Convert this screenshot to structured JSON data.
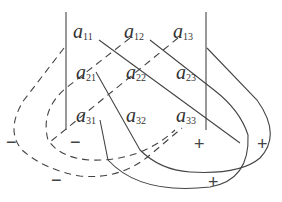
{
  "diagram": {
    "type": "sarrus-rule-determinant",
    "elements": [
      {
        "id": "a11",
        "base": "a",
        "sub": "11",
        "x": 73,
        "y": 38
      },
      {
        "id": "a12",
        "base": "a",
        "sub": "12",
        "x": 124,
        "y": 38
      },
      {
        "id": "a13",
        "base": "a",
        "sub": "13",
        "x": 173,
        "y": 38
      },
      {
        "id": "a21",
        "base": "a",
        "sub": "21",
        "x": 76,
        "y": 79
      },
      {
        "id": "a22",
        "base": "a",
        "sub": "22",
        "x": 126,
        "y": 79
      },
      {
        "id": "a23",
        "base": "a",
        "sub": "23",
        "x": 176,
        "y": 79
      },
      {
        "id": "a31",
        "base": "a",
        "sub": "31",
        "x": 76,
        "y": 122
      },
      {
        "id": "a32",
        "base": "a",
        "sub": "32",
        "x": 126,
        "y": 122
      },
      {
        "id": "a33",
        "base": "a",
        "sub": "33",
        "x": 176,
        "y": 122
      }
    ],
    "signs": [
      {
        "text": "−",
        "x": 6,
        "y": 148
      },
      {
        "text": "−",
        "x": 70,
        "y": 148
      },
      {
        "text": "−",
        "x": 51,
        "y": 186
      },
      {
        "text": "+",
        "x": 194,
        "y": 150
      },
      {
        "text": "+",
        "x": 257,
        "y": 150
      },
      {
        "text": "+",
        "x": 208,
        "y": 188
      }
    ],
    "colors": {
      "line": "#444444",
      "text": "#333333",
      "background": "#ffffff"
    }
  }
}
